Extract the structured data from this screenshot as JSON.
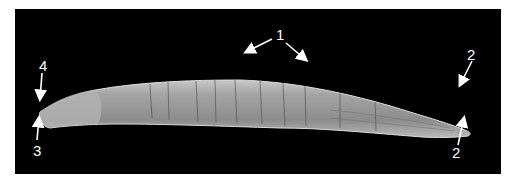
{
  "figure": {
    "background_color": "#000000",
    "specimen_color": "#9a9a9a",
    "annotation_color": "#ffffff"
  },
  "labels": [
    {
      "id": "1",
      "text": "1",
      "x": 276,
      "y": 27,
      "arrows": 2,
      "points_to": "body cuticle (dorsal surface)"
    },
    {
      "id": "2a",
      "text": "2",
      "x": 467,
      "y": 47,
      "arrows": 1,
      "points_to": "tail region (dorsal)"
    },
    {
      "id": "2b",
      "text": "2",
      "x": 452,
      "y": 145,
      "arrows": 1,
      "points_to": "tail region (ventral)"
    },
    {
      "id": "3",
      "text": "3",
      "x": 33,
      "y": 143,
      "arrows": 1,
      "points_to": "anterior tip (ventral)"
    },
    {
      "id": "4",
      "text": "4",
      "x": 39,
      "y": 58,
      "arrows": 1,
      "points_to": "anterior tip (dorsal)"
    }
  ]
}
